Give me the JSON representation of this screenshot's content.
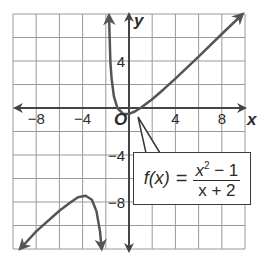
{
  "chart_data": {
    "type": "line",
    "title": "",
    "function_label": "f(x) = (x^2 - 1)/(x + 2)",
    "xlabel": "x",
    "ylabel": "y",
    "origin_label": "O",
    "xlim": [
      -10,
      10
    ],
    "ylim": [
      -12,
      8
    ],
    "grid": true,
    "grid_step": 2,
    "x_ticks": [
      {
        "value": -8,
        "label": "−8"
      },
      {
        "value": -4,
        "label": "−4"
      },
      {
        "value": 4,
        "label": "4"
      },
      {
        "value": 8,
        "label": "8"
      }
    ],
    "y_ticks": [
      {
        "value": 4,
        "label": "4"
      },
      {
        "value": -4,
        "label": "−4"
      },
      {
        "value": -8,
        "label": "−8"
      }
    ],
    "vertical_asymptote": -2,
    "series": [
      {
        "name": "right branch",
        "points": [
          [
            -1.72,
            7.9
          ],
          [
            -1.6,
            3.9
          ],
          [
            -1.5,
            2.5
          ],
          [
            -1.3,
            1.0
          ],
          [
            -1.0,
            0.0
          ],
          [
            -0.5,
            -0.5
          ],
          [
            0,
            -0.5
          ],
          [
            0.5,
            -0.3
          ],
          [
            1,
            0
          ],
          [
            2,
            0.75
          ],
          [
            3,
            1.6
          ],
          [
            4,
            2.5
          ],
          [
            6,
            4.375
          ],
          [
            8,
            6.3
          ],
          [
            9.8,
            8.0
          ]
        ]
      },
      {
        "name": "left branch",
        "points": [
          [
            -9.4,
            -12.0
          ],
          [
            -8,
            -10.5
          ],
          [
            -6,
            -8.75
          ],
          [
            -5,
            -8.0
          ],
          [
            -4.4,
            -7.6
          ],
          [
            -3.73,
            -7.46
          ],
          [
            -3.2,
            -7.8
          ],
          [
            -2.8,
            -8.8
          ],
          [
            -2.5,
            -10.5
          ],
          [
            -2.35,
            -12.0
          ]
        ]
      }
    ]
  },
  "formula": {
    "lhs": "f(x)",
    "eq": "=",
    "numerator_base": "x",
    "numerator_exp": "2",
    "numerator_rest": " − 1",
    "denominator": "x + 2"
  },
  "colors": {
    "curve": "#555555",
    "axis": "#444444",
    "grid": "#9a9a9a"
  }
}
